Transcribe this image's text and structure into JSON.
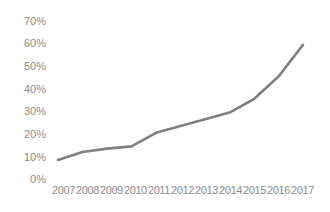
{
  "chart_data": {
    "type": "line",
    "title": "",
    "subtitle": "",
    "xlabel": "",
    "ylabel": "",
    "categories": [
      "2007",
      "2008",
      "2009",
      "2010",
      "2011",
      "2012",
      "2013",
      "2014",
      "2015",
      "2016",
      "2017"
    ],
    "series": [
      {
        "name": "",
        "values": [
          8,
          11.5,
          13,
          14,
          20,
          23,
          26,
          29,
          35,
          45,
          59
        ]
      }
    ],
    "ylim": [
      0,
      70
    ],
    "ytick_labels": [
      "0%",
      "10%",
      "20%",
      "30%",
      "40%",
      "50%",
      "60%",
      "70%"
    ],
    "ytick_values": [
      0,
      10,
      20,
      30,
      40,
      50,
      60,
      70
    ],
    "grid": false,
    "legend": false,
    "legend_position": "none",
    "line_color": "#808080",
    "text_color": "#8c8c8c",
    "background_color": "#ffffff",
    "annotations": []
  }
}
